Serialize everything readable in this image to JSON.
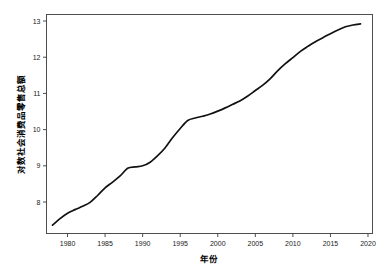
{
  "chart_data": {
    "type": "line",
    "title": "",
    "subtitle": "",
    "xlabel": "年份",
    "ylabel": "对数社会消费品零售总额",
    "xlim": [
      1977.2,
      2020.6
    ],
    "ylim": [
      7.13,
      13.18
    ],
    "xticks": [
      1980,
      1985,
      1990,
      1995,
      2000,
      2005,
      2010,
      2015,
      2020
    ],
    "xtick_labels": [
      "1980",
      "1985",
      "1990",
      "1995",
      "2000",
      "2005",
      "2010",
      "2015",
      "2020"
    ],
    "yticks": [
      8,
      9,
      10,
      11,
      12,
      13
    ],
    "ytick_labels": [
      "8",
      "9",
      "10",
      "11",
      "12",
      "13"
    ],
    "grid": false,
    "legend": false,
    "legend_position": "none",
    "line_color": "#111111",
    "line_width": 1.7,
    "x": [
      1978,
      1979,
      1980,
      1981,
      1982,
      1983,
      1984,
      1985,
      1986,
      1987,
      1988,
      1989,
      1990,
      1991,
      1992,
      1993,
      1994,
      1995,
      1996,
      1997,
      1998,
      1999,
      2000,
      2001,
      2002,
      2003,
      2004,
      2005,
      2006,
      2007,
      2008,
      2009,
      2010,
      2011,
      2012,
      2013,
      2014,
      2015,
      2016,
      2017,
      2018,
      2019
    ],
    "values": [
      7.36,
      7.54,
      7.69,
      7.79,
      7.88,
      7.99,
      8.18,
      8.39,
      8.55,
      8.72,
      8.93,
      8.97,
      9.0,
      9.1,
      9.28,
      9.5,
      9.78,
      10.03,
      10.25,
      10.32,
      10.37,
      10.43,
      10.51,
      10.6,
      10.7,
      10.8,
      10.93,
      11.08,
      11.23,
      11.41,
      11.63,
      11.82,
      11.99,
      12.16,
      12.3,
      12.43,
      12.54,
      12.65,
      12.75,
      12.84,
      12.89,
      12.92
    ],
    "series": [
      {
        "name": "对数社会消费品零售总额",
        "values": [
          7.36,
          7.54,
          7.69,
          7.79,
          7.88,
          7.99,
          8.18,
          8.39,
          8.55,
          8.72,
          8.93,
          8.97,
          9.0,
          9.1,
          9.28,
          9.5,
          9.78,
          10.03,
          10.25,
          10.32,
          10.37,
          10.43,
          10.51,
          10.6,
          10.7,
          10.8,
          10.93,
          11.08,
          11.23,
          11.41,
          11.63,
          11.82,
          11.99,
          12.16,
          12.3,
          12.43,
          12.54,
          12.65,
          12.75,
          12.84,
          12.89,
          12.92
        ]
      }
    ],
    "annotations": []
  }
}
